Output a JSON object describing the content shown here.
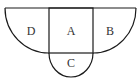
{
  "diagram": {
    "type": "geometry-figure",
    "regions": [
      {
        "id": "D",
        "label": "D",
        "shape": "quarter-circle"
      },
      {
        "id": "A",
        "label": "A",
        "shape": "square"
      },
      {
        "id": "B",
        "label": "B",
        "shape": "quarter-circle"
      },
      {
        "id": "C",
        "label": "C",
        "shape": "semicircle"
      }
    ],
    "stroke_color": "#1a1a1a",
    "background": "#ffffff"
  }
}
